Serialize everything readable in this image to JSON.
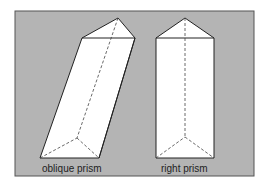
{
  "figure": {
    "background": "#ffffff",
    "panel_color": "#b4b4b4",
    "frame_color": "#555555",
    "face_color": "#ffffff",
    "edge_color": "#222222",
    "hidden_edge_color": "#444444"
  },
  "prisms": [
    {
      "name": "oblique prism",
      "label": "oblique prism",
      "top": [
        [
          82,
          38
        ],
        [
          118,
          18
        ],
        [
          135,
          38
        ]
      ],
      "bottom": [
        [
          40,
          158
        ],
        [
          77,
          138
        ],
        [
          99,
          158
        ]
      ]
    },
    {
      "name": "right prism",
      "label": "right prism",
      "top": [
        [
          156,
          38
        ],
        [
          185,
          18
        ],
        [
          214,
          38
        ]
      ],
      "bottom": [
        [
          156,
          158
        ],
        [
          185,
          137
        ],
        [
          214,
          158
        ]
      ]
    }
  ]
}
